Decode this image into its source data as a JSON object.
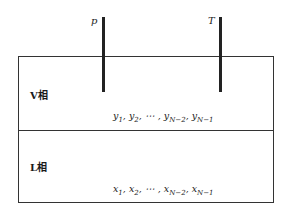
{
  "diagram": {
    "rods": [
      {
        "label": "p",
        "name": "pressure"
      },
      {
        "label": "T",
        "name": "temperature"
      }
    ],
    "phases": [
      {
        "label": "V相",
        "composition": "y1, y2, ⋯ , yN−2, yN−1",
        "terms": [
          {
            "v": "y",
            "s": "1"
          },
          {
            "v": "y",
            "s": "2"
          },
          {
            "v": "⋯",
            "s": ""
          },
          {
            "v": "y",
            "s": "N−2"
          },
          {
            "v": "y",
            "s": "N−1"
          }
        ]
      },
      {
        "label": "L相",
        "composition": "x1, x2, ⋯ , xN−2, xN−1",
        "terms": [
          {
            "v": "x",
            "s": "1"
          },
          {
            "v": "x",
            "s": "2"
          },
          {
            "v": "⋯",
            "s": ""
          },
          {
            "v": "x",
            "s": "N−2"
          },
          {
            "v": "x",
            "s": "N−1"
          }
        ]
      }
    ]
  }
}
